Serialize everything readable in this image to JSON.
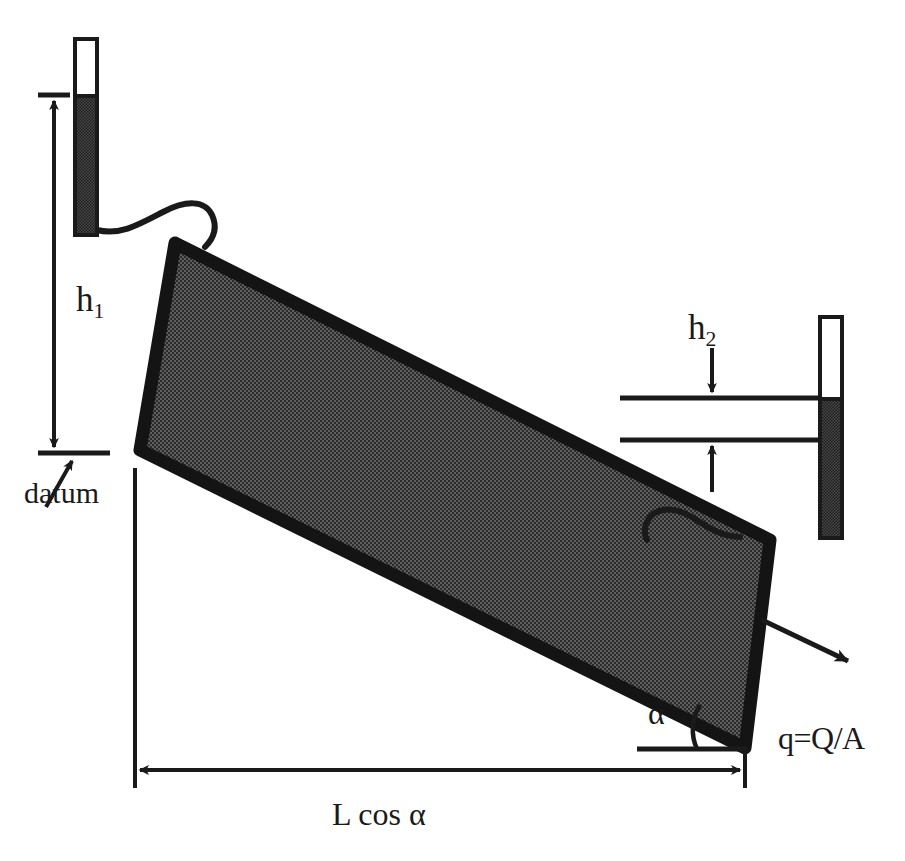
{
  "figure": {
    "background_color": "#ffffff",
    "ink_color": "#1a1a1a",
    "soil_fill_color": "#595959",
    "soil_border_color": "#141414",
    "water_fill_color": "#3a3a3a"
  },
  "labels": {
    "h1": {
      "base": "h",
      "sub": "1"
    },
    "h2": {
      "base": "h",
      "sub": "2"
    },
    "datum": "datum",
    "alpha": "α",
    "flux": "q=Q/A",
    "length": "L cos α"
  },
  "components": {
    "left_manometer": {
      "name": "left-manometer-tube",
      "x": 75,
      "y": 39,
      "width": 22,
      "height": 196,
      "water_level_y": 96
    },
    "right_manometer": {
      "name": "right-manometer-tube",
      "x": 820,
      "y": 317,
      "width": 22,
      "height": 221,
      "water_level_y": 399
    },
    "soil_column": {
      "name": "inclined-soil-column",
      "corners": [
        [
          175,
          243
        ],
        [
          770,
          540
        ],
        [
          745,
          748
        ],
        [
          140,
          450
        ]
      ]
    },
    "datum_line": {
      "x1": 38,
      "x2": 110,
      "y": 453
    },
    "h1_top_tick": {
      "x1": 38,
      "x2": 70,
      "y": 95
    },
    "h2_upper_line": {
      "x1": 620,
      "x2": 818,
      "y": 398
    },
    "h2_lower_line": {
      "x1": 620,
      "x2": 818,
      "y": 440
    },
    "lcos_dimension": {
      "x1": 135,
      "x2": 745,
      "y": 770
    },
    "alpha_baseline": {
      "x1": 637,
      "x2": 745,
      "y": 749
    },
    "flux_arrow": {
      "x1": 762,
      "y1": 620,
      "x2": 845,
      "y2": 660
    }
  }
}
